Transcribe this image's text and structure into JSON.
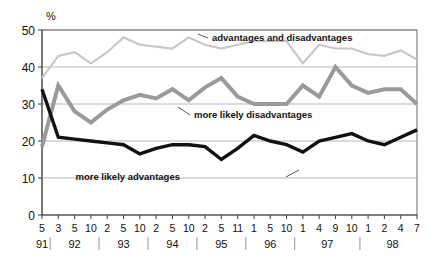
{
  "chart_data": {
    "type": "line",
    "title": "",
    "subtitle": "",
    "xlabel": "",
    "ylabel": "",
    "unit_label": "%",
    "ylim": [
      0,
      50
    ],
    "y_ticks": [
      50,
      40,
      30,
      20,
      10,
      0
    ],
    "grid": true,
    "legend_position": "inline-annotations",
    "x_tick_labels": [
      "5",
      "3",
      "5",
      "10",
      "2",
      "5",
      "10",
      "2",
      "5",
      "10",
      "2",
      "5",
      "11",
      "1",
      "5",
      "10",
      "1",
      "4",
      "9",
      "10",
      "1",
      "2",
      "4",
      "7"
    ],
    "x_group_labels": [
      "91",
      "92",
      "93",
      "94",
      "95",
      "96",
      "97",
      "98"
    ],
    "x_group_spans": [
      1,
      3,
      3,
      3,
      3,
      3,
      4,
      4
    ],
    "series": [
      {
        "name": "advantages and disadvantages",
        "color": "#c8c8c8",
        "values": [
          37,
          43,
          44,
          41,
          44,
          48,
          46,
          45.5,
          45,
          48,
          46,
          45,
          46,
          47,
          47,
          47,
          41,
          46,
          45,
          45,
          43.5,
          43,
          44.5,
          42
        ]
      },
      {
        "name": "more likely disadvantages",
        "color": "#9a9a9a",
        "values": [
          18.5,
          35,
          28,
          25,
          28.5,
          31,
          32.5,
          31.5,
          34,
          31,
          34.5,
          37,
          32,
          30,
          30,
          30,
          35,
          32,
          40,
          35,
          33,
          34,
          34,
          30
        ]
      },
      {
        "name": "more likely advantages",
        "color": "#121212",
        "values": [
          34,
          21,
          20.5,
          20,
          19.5,
          19,
          16.5,
          18,
          19,
          19,
          18.5,
          15,
          18,
          21.5,
          20,
          19,
          17,
          20,
          21,
          22,
          20,
          19,
          21,
          23
        ]
      }
    ],
    "annotations": [
      {
        "text": "advantages and disadvantages",
        "series": "advantages and disadvantages",
        "text_x": 212,
        "text_y": 41,
        "leader_from_x": 208,
        "leader_from_y": 38,
        "leader_to_x": 198,
        "leader_to_y": 34
      },
      {
        "text": "more likely disadvantages",
        "series": "more likely disadvantages",
        "text_x": 194,
        "text_y": 118,
        "leader_from_x": 190,
        "leader_from_y": 115,
        "leader_to_x": 178,
        "leader_to_y": 107
      },
      {
        "text": "more likely advantages",
        "series": "more likely advantages",
        "text_x": 180,
        "text_y": 180,
        "leader_from_x": 286,
        "leader_from_y": 177,
        "leader_to_x": 299,
        "leader_to_y": 170
      }
    ]
  }
}
